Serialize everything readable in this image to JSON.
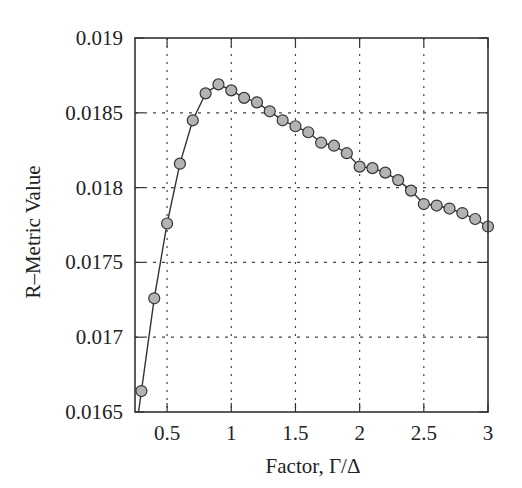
{
  "chart_data": {
    "type": "line",
    "title": "",
    "xlabel": "Factor, Γ/Δ",
    "ylabel": "R–Metric Value",
    "xlim": [
      0.25,
      3.0
    ],
    "ylim": [
      0.0165,
      0.019
    ],
    "xticks": [
      0.5,
      1,
      1.5,
      2,
      2.5,
      3
    ],
    "xtick_labels": [
      "0.5",
      "1",
      "1.5",
      "2",
      "2.5",
      "3"
    ],
    "yticks": [
      0.0165,
      0.017,
      0.0175,
      0.018,
      0.0185,
      0.019
    ],
    "ytick_labels": [
      "0.0165",
      "0.017",
      "0.0175",
      "0.018",
      "0.0185",
      "0.019"
    ],
    "grid": true,
    "grid_style": "dotted",
    "legend": null,
    "series": [
      {
        "name": "R-Metric",
        "marker": "circle",
        "marker_fill": "#b3b3b3",
        "line_color": "#333333",
        "x": [
          0.3,
          0.4,
          0.5,
          0.6,
          0.7,
          0.8,
          0.9,
          1.0,
          1.1,
          1.2,
          1.3,
          1.4,
          1.5,
          1.6,
          1.7,
          1.8,
          1.9,
          2.0,
          2.1,
          2.2,
          2.3,
          2.4,
          2.5,
          2.6,
          2.7,
          2.8,
          2.9,
          3.0
        ],
        "values": [
          0.01664,
          0.01726,
          0.01776,
          0.01816,
          0.01845,
          0.01863,
          0.01869,
          0.01865,
          0.0186,
          0.01857,
          0.01851,
          0.01845,
          0.01841,
          0.01837,
          0.0183,
          0.01828,
          0.01823,
          0.01814,
          0.01813,
          0.0181,
          0.01805,
          0.01798,
          0.01789,
          0.01788,
          0.01786,
          0.01783,
          0.01779,
          0.01774
        ]
      }
    ]
  }
}
